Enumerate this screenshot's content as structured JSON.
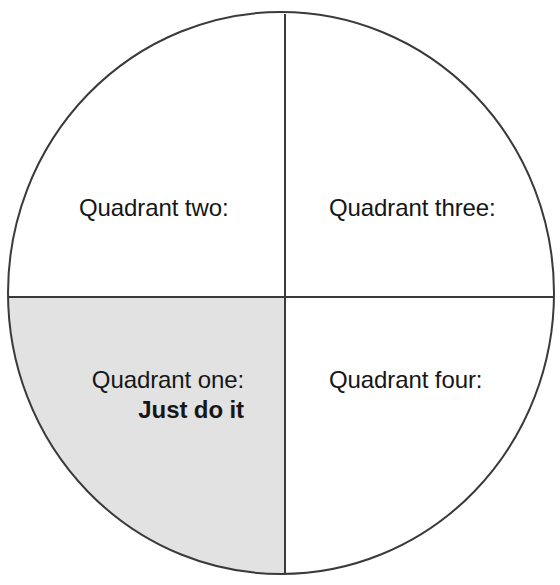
{
  "diagram": {
    "type": "quadrant-circle",
    "shape": "circle",
    "colors": {
      "stroke": "#3a3a3a",
      "background": "#ffffff",
      "shaded_fill": "#e2e2e2",
      "text": "#161616"
    },
    "circle": {
      "center_x": 281,
      "center_y": 293,
      "radius_x": 273,
      "radius_y": 281,
      "stroke_width": 2
    },
    "dividers": {
      "vertical_x": 285,
      "horizontal_y": 297,
      "stroke_width": 2
    },
    "quadrants": [
      {
        "id": "quadrant-two",
        "position": "upper-left",
        "label": "Quadrant two:",
        "shaded": false,
        "note": ""
      },
      {
        "id": "quadrant-three",
        "position": "upper-right",
        "label": "Quadrant three:",
        "shaded": false,
        "note": ""
      },
      {
        "id": "quadrant-one",
        "position": "lower-left",
        "label": "Quadrant one:",
        "shaded": true,
        "note": "Just do it"
      },
      {
        "id": "quadrant-four",
        "position": "lower-right",
        "label": "Quadrant four:",
        "shaded": false,
        "note": ""
      }
    ]
  }
}
